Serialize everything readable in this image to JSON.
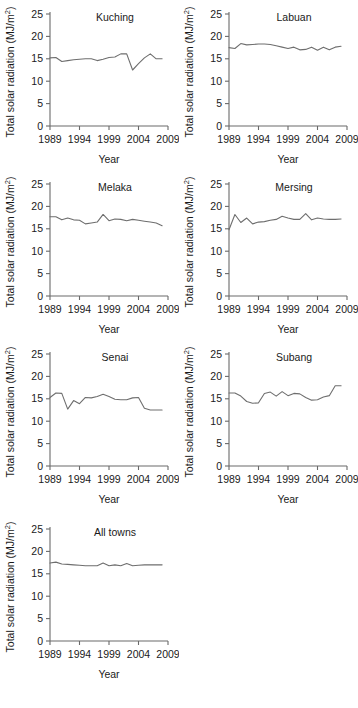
{
  "figure": {
    "axis_titles": {
      "x": "Year",
      "y": "Total solar radiation (MJ/m"
    },
    "y_superscript": "2",
    "y_close": ")",
    "y_unit_prefix": "(MJ/m"
  },
  "chart_data": [
    {
      "type": "line",
      "title": "Kuching",
      "xlabel": "Year",
      "ylabel": "Total solar radiation (MJ/m2)",
      "xlim": [
        1989,
        2009
      ],
      "ylim": [
        0,
        25
      ],
      "yticks": [
        0,
        5,
        10,
        15,
        20,
        25
      ],
      "xticks": [
        1989,
        1994,
        1999,
        2004,
        2009
      ],
      "grid": false,
      "legend": "none",
      "x": [
        1989,
        1990,
        1991,
        1992,
        1993,
        1994,
        1995,
        1996,
        1997,
        1998,
        1999,
        2000,
        2001,
        2002,
        2003,
        2004,
        2005,
        2006,
        2007,
        2008
      ],
      "values": [
        15.2,
        15.3,
        14.4,
        14.6,
        14.8,
        14.9,
        15.0,
        15.0,
        14.6,
        14.9,
        15.3,
        15.4,
        16.1,
        16.1,
        12.5,
        13.9,
        15.2,
        16.1,
        15.0,
        15.0
      ]
    },
    {
      "type": "line",
      "title": "Labuan",
      "xlabel": "Year",
      "ylabel": "Total solar radiation (MJ/m2)",
      "xlim": [
        1989,
        2009
      ],
      "ylim": [
        0,
        25
      ],
      "yticks": [
        0,
        5,
        10,
        15,
        20,
        25
      ],
      "xticks": [
        1989,
        1994,
        1999,
        2004,
        2009
      ],
      "grid": false,
      "legend": "none",
      "x": [
        1989,
        1990,
        1991,
        1992,
        1993,
        1994,
        1995,
        1996,
        1997,
        1998,
        1999,
        2000,
        2001,
        2002,
        2003,
        2004,
        2005,
        2006,
        2007,
        2008
      ],
      "values": [
        17.5,
        17.3,
        18.4,
        18.1,
        18.2,
        18.3,
        18.3,
        18.2,
        17.9,
        17.6,
        17.3,
        17.6,
        17.0,
        17.1,
        17.6,
        16.9,
        17.6,
        17.0,
        17.6,
        17.8
      ]
    },
    {
      "type": "line",
      "title": "Melaka",
      "xlabel": "Year",
      "ylabel": "Total solar radiation (MJ/m2)",
      "xlim": [
        1989,
        2009
      ],
      "ylim": [
        0,
        25
      ],
      "yticks": [
        0,
        5,
        10,
        15,
        20,
        25
      ],
      "xticks": [
        1989,
        1994,
        1999,
        2004,
        2009
      ],
      "grid": false,
      "legend": "none",
      "x": [
        1989,
        1990,
        1991,
        1992,
        1993,
        1994,
        1995,
        1996,
        1997,
        1998,
        1999,
        2000,
        2001,
        2002,
        2003,
        2004,
        2005,
        2006,
        2007,
        2008
      ],
      "values": [
        17.7,
        17.7,
        17.0,
        17.4,
        17.0,
        16.9,
        16.1,
        16.3,
        16.5,
        18.2,
        16.8,
        17.2,
        17.1,
        16.8,
        17.1,
        16.9,
        16.7,
        16.5,
        16.3,
        15.7
      ]
    },
    {
      "type": "line",
      "title": "Mersing",
      "xlabel": "Year",
      "ylabel": "Total solar radiation (MJ/m2)",
      "xlim": [
        1989,
        2009
      ],
      "ylim": [
        0,
        25
      ],
      "yticks": [
        0,
        5,
        10,
        15,
        20,
        25
      ],
      "xticks": [
        1989,
        1994,
        1999,
        2004,
        2009
      ],
      "grid": false,
      "legend": "none",
      "x": [
        1989,
        1990,
        1991,
        1992,
        1993,
        1994,
        1995,
        1996,
        1997,
        1998,
        1999,
        2000,
        2001,
        2002,
        2003,
        2004,
        2005,
        2006,
        2007,
        2008
      ],
      "values": [
        14.8,
        18.2,
        16.4,
        17.4,
        16.1,
        16.5,
        16.6,
        16.9,
        17.1,
        17.8,
        17.4,
        17.1,
        17.1,
        18.4,
        17.0,
        17.4,
        17.2,
        17.1,
        17.1,
        17.2
      ]
    },
    {
      "type": "line",
      "title": "Senai",
      "xlabel": "Year",
      "ylabel": "Total solar radiation (MJ/m2)",
      "xlim": [
        1989,
        2009
      ],
      "ylim": [
        0,
        25
      ],
      "yticks": [
        0,
        5,
        10,
        15,
        20,
        25
      ],
      "xticks": [
        1989,
        1994,
        1999,
        2004,
        2009
      ],
      "grid": false,
      "legend": "none",
      "x": [
        1989,
        1990,
        1991,
        1992,
        1993,
        1994,
        1995,
        1996,
        1997,
        1998,
        1999,
        2000,
        2001,
        2002,
        2003,
        2004,
        2005,
        2006,
        2007,
        2008
      ],
      "values": [
        15.3,
        16.3,
        16.2,
        12.7,
        14.6,
        13.9,
        15.3,
        15.2,
        15.5,
        16.0,
        15.5,
        14.9,
        14.8,
        14.8,
        15.2,
        15.3,
        12.9,
        12.5,
        12.5,
        12.5
      ]
    },
    {
      "type": "line",
      "title": "Subang",
      "xlabel": "Year",
      "ylabel": "Total solar radiation (MJ/m2)",
      "xlim": [
        1989,
        2009
      ],
      "ylim": [
        0,
        25
      ],
      "yticks": [
        0,
        5,
        10,
        15,
        20,
        25
      ],
      "xticks": [
        1989,
        1994,
        1999,
        2004,
        2009
      ],
      "grid": false,
      "legend": "none",
      "x": [
        1989,
        1990,
        1991,
        1992,
        1993,
        1994,
        1995,
        1996,
        1997,
        1998,
        1999,
        2000,
        2001,
        2002,
        2003,
        2004,
        2005,
        2006,
        2007,
        2008
      ],
      "values": [
        16.3,
        16.3,
        15.6,
        14.4,
        14.0,
        14.1,
        16.2,
        16.5,
        15.6,
        16.6,
        15.7,
        16.2,
        16.1,
        15.3,
        14.7,
        14.8,
        15.4,
        15.7,
        17.9,
        17.9
      ]
    },
    {
      "type": "line",
      "title": "All towns",
      "xlabel": "Year",
      "ylabel": "Total solar radiation (MJ/m2)",
      "xlim": [
        1989,
        2009
      ],
      "ylim": [
        0,
        25
      ],
      "yticks": [
        0,
        5,
        10,
        15,
        20,
        25
      ],
      "xticks": [
        1989,
        1994,
        1999,
        2004,
        2009
      ],
      "grid": false,
      "legend": "none",
      "x": [
        1989,
        1990,
        1991,
        1992,
        1993,
        1994,
        1995,
        1996,
        1997,
        1998,
        1999,
        2000,
        2001,
        2002,
        2003,
        2004,
        2005,
        2006,
        2007,
        2008
      ],
      "values": [
        17.4,
        17.6,
        17.2,
        17.1,
        17.0,
        16.9,
        16.8,
        16.8,
        16.8,
        17.4,
        16.8,
        17.0,
        16.8,
        17.3,
        16.8,
        16.9,
        17.0,
        17.0,
        17.0,
        17.0
      ]
    }
  ],
  "panels": [
    {
      "title": "Kuching",
      "x": 0,
      "y": 0
    },
    {
      "title": "Labuan",
      "x": 179,
      "y": 0
    },
    {
      "title": "Melaka",
      "x": 0,
      "y": 170
    },
    {
      "title": "Mersing",
      "x": 179,
      "y": 170
    },
    {
      "title": "Senai",
      "x": 0,
      "y": 340
    },
    {
      "title": "Subang",
      "x": 179,
      "y": 340
    },
    {
      "title": "All towns",
      "x": 0,
      "y": 515
    }
  ]
}
